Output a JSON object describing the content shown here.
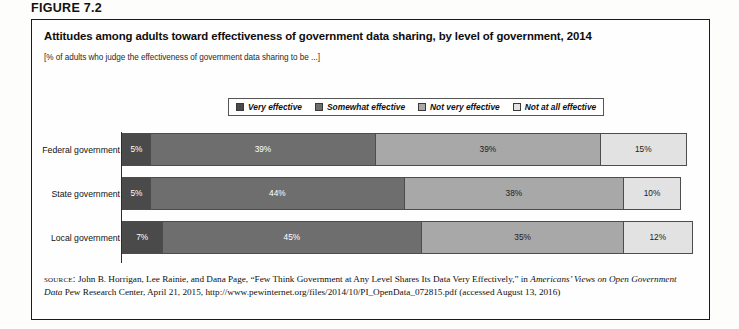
{
  "figure": {
    "header": "FIGURE 7.2",
    "title": "Attitudes among adults toward effectiveness of government data sharing, by level of government, 2014",
    "subtitle": "[% of adults who judge the effectiveness of government data sharing to be ...]"
  },
  "legend": {
    "items": [
      {
        "label": "Very effective",
        "color": "#4a4a4a"
      },
      {
        "label": "Somewhat effective",
        "color": "#6e6e6e"
      },
      {
        "label": "Not very effective",
        "color": "#a8a8a8"
      },
      {
        "label": "Not at all effective",
        "color": "#e2e2e2"
      }
    ]
  },
  "source": {
    "kicker": "source:",
    "text_1": " John B. Horrigan, Lee Rainie, and Dana Page, “Few Think Government at Any Level Shares Its Data Very Effectively,” in ",
    "italic_1": "Americans’ Views on Open Government Data",
    "text_2": " Pew Research Center, April 21, 2015, http://www.pewinternet.org/files/2014/10/PI_OpenData_072815.pdf (accessed August 13, 2016)"
  },
  "chart_data": {
    "type": "bar",
    "orientation": "horizontal",
    "stacked": true,
    "stack_total": 100,
    "title": "Attitudes among adults toward effectiveness of government data sharing, by level of government, 2014",
    "subtitle": "[% of adults who judge the effectiveness of government data sharing to be ...]",
    "xlabel": "",
    "ylabel": "",
    "xlim": [
      0,
      100
    ],
    "grid": false,
    "legend_position": "top-center",
    "categories": [
      "Federal government",
      "State government",
      "Local government"
    ],
    "series": [
      {
        "name": "Very effective",
        "color": "#4a4a4a",
        "text_color": "#ffffff",
        "values": [
          5,
          5,
          7
        ]
      },
      {
        "name": "Somewhat effective",
        "color": "#6e6e6e",
        "text_color": "#ffffff",
        "values": [
          39,
          44,
          45
        ]
      },
      {
        "name": "Not very effective",
        "color": "#a8a8a8",
        "text_color": "#1a1a1a",
        "values": [
          39,
          38,
          35
        ]
      },
      {
        "name": "Not at all effective",
        "color": "#e2e2e2",
        "text_color": "#1a1a1a",
        "values": [
          15,
          10,
          12
        ]
      }
    ],
    "data_labels": [
      [
        "5%",
        "39%",
        "39%",
        "15%"
      ],
      [
        "5%",
        "44%",
        "38%",
        "10%"
      ],
      [
        "7%",
        "45%",
        "35%",
        "12%"
      ]
    ]
  }
}
